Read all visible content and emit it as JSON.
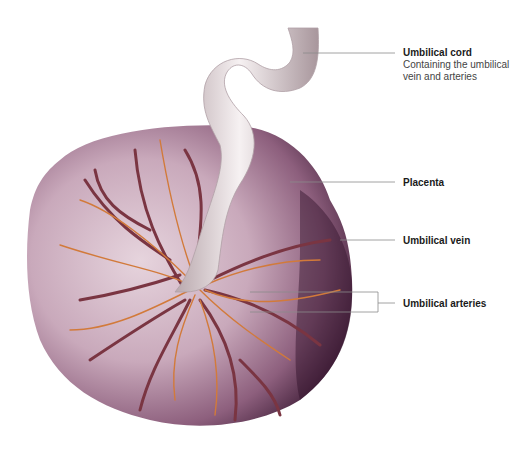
{
  "figure": {
    "colors": {
      "placenta_light": "#d9c3cf",
      "placenta_mid": "#a77e97",
      "placenta_dark": "#3a1430",
      "cord": "#ece4e6",
      "cord_shadow": "#b9a8ad",
      "artery": "#7a3542",
      "vein_branch": "#d27a3a",
      "leader_line": "#8a8a8a"
    }
  },
  "labels": [
    {
      "id": "umbilical-cord",
      "title": "Umbilical cord",
      "description_lines": [
        "Containing the umbilical",
        "vein and arteries"
      ]
    },
    {
      "id": "placenta",
      "title": "Placenta"
    },
    {
      "id": "umbilical-vein",
      "title": "Umbilical vein"
    },
    {
      "id": "umbilical-arteries",
      "title": "Umbilical arteries"
    }
  ]
}
